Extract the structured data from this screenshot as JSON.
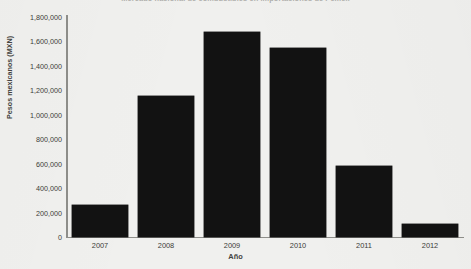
{
  "chart_data": {
    "type": "bar",
    "title": "Mercado nacional de combustibles en importaciones de Pemex",
    "xlabel": "Año",
    "ylabel": "Pesos mexicanos (MXN)",
    "categories": [
      "2007",
      "2008",
      "2009",
      "2010",
      "2011",
      "2012"
    ],
    "values": [
      260000,
      1150000,
      1680000,
      1550000,
      580000,
      110000
    ],
    "ylim": [
      0,
      1800000
    ],
    "ytick_labels": [
      "1,800,000",
      "1,600,000",
      "1,400,000",
      "1,200,000",
      "1,000,000",
      "800,000",
      "600,000",
      "400,000",
      "200,000",
      "0"
    ],
    "ytick_values": [
      1800000,
      1600000,
      1400000,
      1200000,
      1000000,
      800000,
      600000,
      400000,
      200000,
      0
    ],
    "grid": false,
    "legend": null,
    "bar_color": "#121212",
    "background_color": "#f0f0ee",
    "axis_color": "#8e8e8a"
  }
}
